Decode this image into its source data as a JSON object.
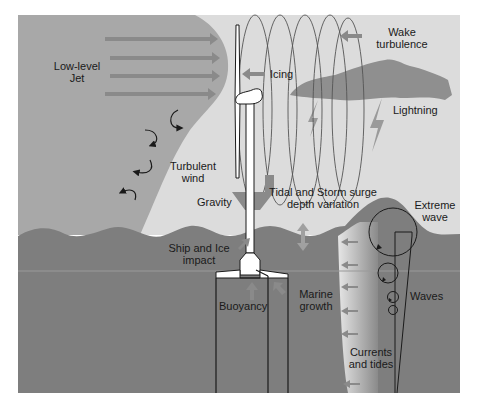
{
  "diagram": {
    "colors": {
      "background": "#ffffff",
      "sky_light": "#dcdcdc",
      "jet_region": "#a8a8a8",
      "sea": "#7e7e7e",
      "cloud": "#8f8f8f",
      "arrow": "#8a8a8a",
      "outline": "#1a1a1a",
      "turbine": "#ffffff"
    },
    "labels": {
      "low_level_jet_1": "Low-level",
      "low_level_jet_2": "Jet",
      "wake_turbulence_1": "Wake",
      "wake_turbulence_2": "turbulence",
      "icing": "Icing",
      "lightning": "Lightning",
      "turbulent_wind_1": "Turbulent",
      "turbulent_wind_2": "wind",
      "gravity": "Gravity",
      "tidal_storm_1": "Tidal and Storm surge",
      "tidal_storm_2": "depth variation",
      "extreme_wave_1": "Extreme",
      "extreme_wave_2": "wave",
      "ship_ice_1": "Ship and Ice",
      "ship_ice_2": "impact",
      "buoyancy": "Buoyancy",
      "marine_growth_1": "Marine",
      "marine_growth_2": "growth",
      "waves": "Waves",
      "currents_tides_1": "Currents",
      "currents_tides_2": "and tides"
    },
    "icons": {
      "jet_arrows": "right-arrow",
      "eddies": "curved-arrow",
      "wake": "left-arrow",
      "lightning": "lightning-bolt",
      "current_arrows": "left-arrow"
    }
  }
}
